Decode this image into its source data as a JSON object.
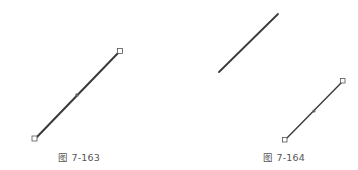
{
  "figures": [
    {
      "caption": "图 7-163",
      "lines": [
        {
          "role": "selected-line",
          "x1": 35,
          "y1": 139,
          "x2": 120,
          "y2": 51,
          "handles": true,
          "midpoint": [
            77,
            95
          ]
        }
      ]
    },
    {
      "caption": "图 7-164",
      "lines": [
        {
          "role": "original-line",
          "x1": 219,
          "y1": 72,
          "x2": 278,
          "y2": 14,
          "handles": false
        },
        {
          "role": "copied-line",
          "x1": 285,
          "y1": 140,
          "x2": 343,
          "y2": 81,
          "handles": true,
          "midpoint": [
            314,
            111
          ]
        }
      ]
    }
  ],
  "colors": {
    "line": "#3a3a3a",
    "handle_stroke": "#555555",
    "handle_fill": "#ffffff",
    "caption": "#555555"
  }
}
